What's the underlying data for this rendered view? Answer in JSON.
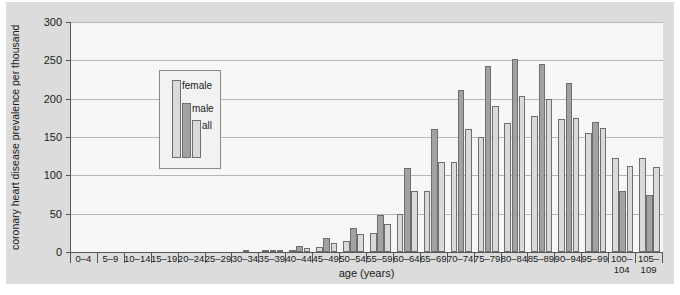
{
  "chart_data": {
    "type": "bar",
    "title": "",
    "xlabel": "age (years)",
    "ylabel": "coronary heart disease prevalence per thousand",
    "ylim": [
      0,
      300
    ],
    "yticks": [
      0,
      50,
      100,
      150,
      200,
      250,
      300
    ],
    "grid": true,
    "legend_position": "inside-top-left",
    "categories": [
      "0–4",
      "5–9",
      "10–14",
      "15–19",
      "20–24",
      "25–29",
      "30–34",
      "35–39",
      "40–44",
      "45–49",
      "50–54",
      "55–59",
      "60–64",
      "65–69",
      "70–74",
      "75–79",
      "80–84",
      "85–89",
      "90–94",
      "95–99",
      "100– 104",
      "105– 109"
    ],
    "series": [
      {
        "name": "female",
        "color": "#dadada",
        "values": [
          0,
          0,
          0,
          0,
          0,
          0,
          0,
          1,
          3,
          6,
          14,
          25,
          50,
          80,
          117,
          150,
          168,
          177,
          174,
          155,
          122,
          123
        ]
      },
      {
        "name": "male",
        "color": "#a2a2a2",
        "values": [
          0,
          0,
          0,
          0,
          0,
          0,
          1,
          3,
          8,
          18,
          31,
          48,
          110,
          161,
          211,
          242,
          252,
          245,
          220,
          170,
          80,
          75
        ]
      },
      {
        "name": "all",
        "color": "#dadada",
        "values": [
          0,
          0,
          0,
          0,
          0,
          0,
          0,
          2,
          5,
          12,
          23,
          36,
          79,
          118,
          160,
          190,
          203,
          200,
          175,
          162,
          112,
          111
        ]
      }
    ]
  },
  "axis": {
    "ytick_labels": [
      "300",
      "250",
      "200",
      "150",
      "100",
      "50",
      "0"
    ],
    "xtitle": "age (years)",
    "ytitle": "coronary heart disease prevalence per thousand"
  },
  "legend": {
    "items": [
      {
        "label": "female",
        "color": "#dadada"
      },
      {
        "label": "male",
        "color": "#a2a2a2"
      },
      {
        "label": "all",
        "color": "#dadada"
      }
    ]
  }
}
